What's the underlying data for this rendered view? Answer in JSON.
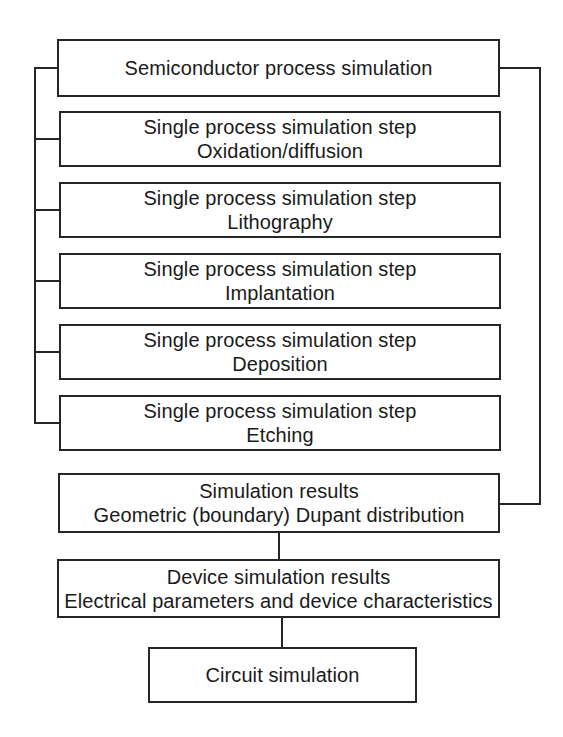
{
  "colors": {
    "ink": "#1a1a1a",
    "line": "#262626",
    "background": "#ffffff"
  },
  "diagram": {
    "type": "flowchart",
    "nodes": [
      {
        "id": "semiconductor-process-simulation",
        "lines": [
          "Semiconductor process simulation"
        ]
      },
      {
        "id": "step-oxidation-diffusion",
        "lines": [
          "Single process simulation step",
          "Oxidation/diffusion"
        ]
      },
      {
        "id": "step-lithography",
        "lines": [
          "Single process simulation step",
          "Lithography"
        ]
      },
      {
        "id": "step-implantation",
        "lines": [
          "Single process simulation step",
          "Implantation"
        ]
      },
      {
        "id": "step-deposition",
        "lines": [
          "Single process simulation step",
          "Deposition"
        ]
      },
      {
        "id": "step-etching",
        "lines": [
          "Single process simulation step",
          "Etching"
        ]
      },
      {
        "id": "simulation-results",
        "lines": [
          "Simulation results",
          "Geometric (boundary) Dupant distribution"
        ]
      },
      {
        "id": "device-simulation-results",
        "lines": [
          "Device simulation results",
          "Electrical parameters and device characteristics"
        ]
      },
      {
        "id": "circuit-simulation",
        "lines": [
          "Circuit simulation"
        ]
      }
    ],
    "edges": [
      "semiconductor-process-simulation -> each single process simulation step (left bus)",
      "semiconductor-process-simulation -> simulation-results (right bus)",
      "simulation-results -> device-simulation-results",
      "device-simulation-results -> circuit-simulation"
    ]
  }
}
